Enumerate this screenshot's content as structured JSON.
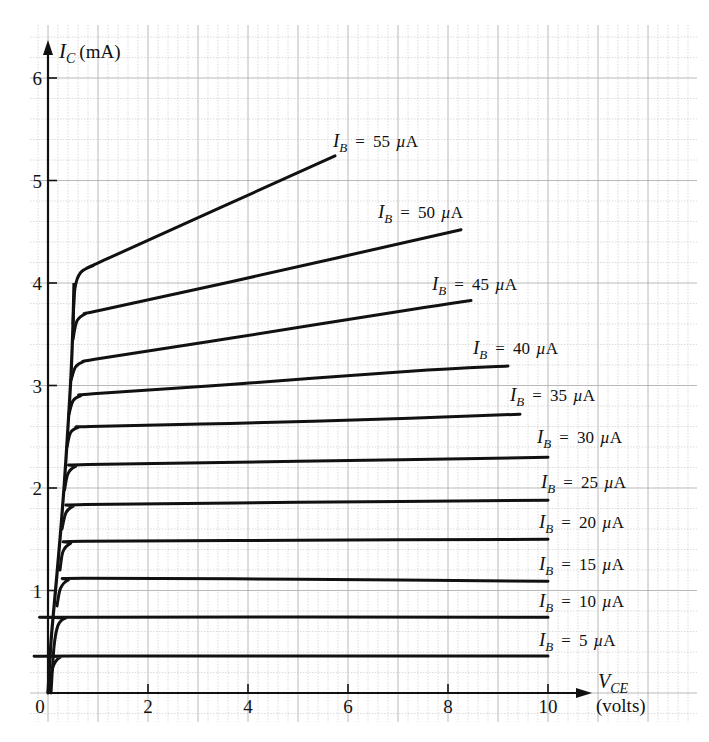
{
  "chart_data": {
    "type": "line",
    "title": "",
    "xlabel": "V_CE (volts)",
    "ylabel": "I_C (mA)",
    "xlabel_parts": {
      "symbol": "V",
      "subscript": "CE",
      "unit": "(volts)"
    },
    "ylabel_parts": {
      "symbol": "I",
      "subscript": "C",
      "unit": "(mA)"
    },
    "xlim": [
      0,
      10
    ],
    "ylim": [
      0,
      6
    ],
    "x_ticks": [
      "0",
      "2",
      "4",
      "6",
      "8",
      "10"
    ],
    "x_tick_values": [
      0,
      2,
      4,
      6,
      8,
      10
    ],
    "y_ticks": [
      "1",
      "2",
      "3",
      "4",
      "5",
      "6"
    ],
    "y_tick_values": [
      1,
      2,
      3,
      4,
      5,
      6
    ],
    "grid": true,
    "legend_position": "inline labels at curve ends",
    "series": [
      {
        "name": "I_B = 5 µA",
        "label_value": "5",
        "points": [
          [
            0,
            0
          ],
          [
            0.05,
            0.15
          ],
          [
            0.12,
            0.28
          ],
          [
            0.25,
            0.35
          ],
          [
            0.5,
            0.36
          ],
          [
            10,
            0.36
          ]
        ],
        "label_pos": [
          539,
          646
        ]
      },
      {
        "name": "I_B = 10 µA",
        "label_value": "10",
        "points": [
          [
            0.06,
            0
          ],
          [
            0.12,
            0.45
          ],
          [
            0.2,
            0.66
          ],
          [
            0.35,
            0.73
          ],
          [
            0.6,
            0.74
          ],
          [
            10,
            0.74
          ]
        ],
        "label_pos": [
          539,
          607
        ]
      },
      {
        "name": "I_B = 15 µA",
        "label_value": "15",
        "points": [
          [
            0.18,
            0.85
          ],
          [
            0.25,
            1.02
          ],
          [
            0.4,
            1.1
          ],
          [
            0.7,
            1.12
          ],
          [
            5,
            1.11
          ],
          [
            10,
            1.09
          ]
        ],
        "label_pos": [
          539,
          570
        ]
      },
      {
        "name": "I_B = 20 µA",
        "label_value": "20",
        "points": [
          [
            0.24,
            1.2
          ],
          [
            0.3,
            1.38
          ],
          [
            0.45,
            1.46
          ],
          [
            0.7,
            1.48
          ],
          [
            5,
            1.49
          ],
          [
            10,
            1.5
          ]
        ],
        "label_pos": [
          539,
          528
        ]
      },
      {
        "name": "I_B = 25 µA",
        "label_value": "25",
        "points": [
          [
            0.28,
            1.6
          ],
          [
            0.36,
            1.76
          ],
          [
            0.5,
            1.82
          ],
          [
            0.75,
            1.84
          ],
          [
            5,
            1.86
          ],
          [
            10,
            1.88
          ]
        ],
        "label_pos": [
          541,
          488
        ]
      },
      {
        "name": "I_B = 30 µA",
        "label_value": "30",
        "points": [
          [
            0.33,
            1.98
          ],
          [
            0.4,
            2.14
          ],
          [
            0.55,
            2.21
          ],
          [
            0.8,
            2.23
          ],
          [
            5,
            2.26
          ],
          [
            10,
            2.3
          ]
        ],
        "label_pos": [
          537,
          443
        ]
      },
      {
        "name": "I_B = 35 µA",
        "label_value": "35",
        "points": [
          [
            0.38,
            2.4
          ],
          [
            0.45,
            2.54
          ],
          [
            0.6,
            2.59
          ],
          [
            0.85,
            2.6
          ],
          [
            3.64,
            2.63
          ],
          [
            7.24,
            2.68
          ],
          [
            9.44,
            2.72
          ]
        ],
        "label_pos": [
          510,
          401
        ]
      },
      {
        "name": "I_B = 40 µA",
        "label_value": "40",
        "points": [
          [
            0.42,
            2.72
          ],
          [
            0.5,
            2.85
          ],
          [
            0.65,
            2.9
          ],
          [
            0.9,
            2.92
          ],
          [
            3.64,
            3.01
          ],
          [
            7.24,
            3.14
          ],
          [
            9.2,
            3.19
          ]
        ],
        "label_pos": [
          473,
          354
        ]
      },
      {
        "name": "I_B = 45 µA",
        "label_value": "45",
        "points": [
          [
            0.46,
            3.05
          ],
          [
            0.55,
            3.18
          ],
          [
            0.7,
            3.23
          ],
          [
            1.0,
            3.26
          ],
          [
            3.64,
            3.46
          ],
          [
            7.24,
            3.74
          ],
          [
            8.46,
            3.83
          ]
        ],
        "label_pos": [
          432,
          290
        ]
      },
      {
        "name": "I_B = 50 µA",
        "label_value": "50",
        "points": [
          [
            0.5,
            3.45
          ],
          [
            0.58,
            3.63
          ],
          [
            0.75,
            3.7
          ],
          [
            1.0,
            3.73
          ],
          [
            3.64,
            4.01
          ],
          [
            8.26,
            4.52
          ]
        ],
        "label_pos": [
          378,
          218
        ]
      },
      {
        "name": "I_B = 55 µA",
        "label_value": "55",
        "points": [
          [
            0.5,
            3.6
          ],
          [
            0.54,
            3.95
          ],
          [
            0.65,
            4.1
          ],
          [
            0.9,
            4.17
          ],
          [
            1.2,
            4.24
          ],
          [
            5.74,
            5.24
          ]
        ],
        "label_pos": [
          333,
          147
        ]
      }
    ],
    "saturation_envelope": [
      [
        0,
        0
      ],
      [
        0.06,
        0.5
      ],
      [
        0.15,
        1.0
      ],
      [
        0.24,
        1.5
      ],
      [
        0.32,
        2.0
      ],
      [
        0.4,
        2.6
      ],
      [
        0.46,
        3.1
      ],
      [
        0.5,
        3.6
      ],
      [
        0.52,
        4.0
      ]
    ],
    "label_template": {
      "prefix_symbol": "I",
      "prefix_subscript": "B",
      "equals": "=",
      "unit": "µA"
    }
  }
}
